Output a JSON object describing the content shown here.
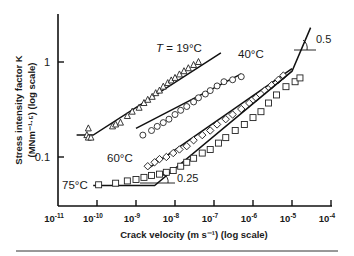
{
  "chart_data": {
    "type": "scatter",
    "title": "",
    "xlabel": "Crack velocity  (m s⁻¹)  (log scale)",
    "ylabel": "Stress intensity factor K",
    "ylabel_units": "(MNm⁻¹·⁵)  (log scale)",
    "x_scale": "log",
    "y_scale": "log",
    "xlim": [
      1e-11,
      0.0001
    ],
    "ylim": [
      0.03,
      3
    ],
    "x_ticks": [
      "10⁻¹¹",
      "10⁻¹⁰",
      "10⁻⁹",
      "10⁻⁸",
      "10⁻⁷",
      "10⁻⁶",
      "10⁻⁵",
      "10⁻⁴"
    ],
    "y_ticks": [
      "1",
      "0.1"
    ],
    "grid": false,
    "legend": "inline labels",
    "series": [
      {
        "name": "T = 19°C",
        "marker": "triangle",
        "points": [
          [
            5.5e-11,
            0.17
          ],
          [
            6e-11,
            0.16
          ],
          [
            7e-11,
            0.16
          ],
          [
            6e-11,
            0.2
          ],
          [
            2.5e-10,
            0.21
          ],
          [
            3e-10,
            0.22
          ],
          [
            4e-10,
            0.23
          ],
          [
            6e-10,
            0.27
          ],
          [
            8e-10,
            0.3
          ],
          [
            1.2e-09,
            0.33
          ],
          [
            1.6e-09,
            0.37
          ],
          [
            2e-09,
            0.4
          ],
          [
            2.6e-09,
            0.43
          ],
          [
            3.2e-09,
            0.47
          ],
          [
            4e-09,
            0.5
          ],
          [
            5e-09,
            0.55
          ],
          [
            6.5e-09,
            0.6
          ],
          [
            8e-09,
            0.64
          ],
          [
            1e-08,
            0.68
          ],
          [
            1.3e-08,
            0.74
          ],
          [
            1.7e-08,
            0.8
          ],
          [
            2.2e-08,
            0.86
          ],
          [
            3e-08,
            0.93
          ],
          [
            4e-08,
            1.0
          ]
        ],
        "fit_line": [
          [
            3e-11,
            0.17
          ],
          [
            8e-11,
            0.17
          ],
          [
            1.5e-07,
            1.25
          ]
        ]
      },
      {
        "name": "40°C",
        "marker": "circle",
        "points": [
          [
            1.5e-09,
            0.17
          ],
          [
            2.5e-09,
            0.19
          ],
          [
            3.5e-09,
            0.21
          ],
          [
            5e-09,
            0.23
          ],
          [
            7e-09,
            0.25
          ],
          [
            1e-08,
            0.28
          ],
          [
            1.4e-08,
            0.31
          ],
          [
            2e-08,
            0.34
          ],
          [
            3e-08,
            0.38
          ],
          [
            4e-08,
            0.42
          ],
          [
            6e-08,
            0.46
          ],
          [
            8e-08,
            0.5
          ],
          [
            1.2e-07,
            0.56
          ],
          [
            1.8e-07,
            0.62
          ],
          [
            3e-07,
            0.65
          ],
          [
            5e-07,
            0.7
          ]
        ],
        "fit_line": [
          [
            1e-09,
            0.2
          ],
          [
            5e-07,
            0.75
          ]
        ]
      },
      {
        "name": "60°C",
        "marker": "diamond",
        "points": [
          [
            2e-09,
            0.08
          ],
          [
            3e-09,
            0.088
          ],
          [
            4e-09,
            0.095
          ],
          [
            6e-09,
            0.1
          ],
          [
            9e-09,
            0.11
          ],
          [
            1.3e-08,
            0.12
          ],
          [
            2e-08,
            0.13
          ],
          [
            3e-08,
            0.15
          ],
          [
            5e-08,
            0.17
          ],
          [
            8e-08,
            0.19
          ],
          [
            1.2e-07,
            0.22
          ],
          [
            2e-07,
            0.25
          ],
          [
            3e-07,
            0.28
          ],
          [
            5e-07,
            0.32
          ],
          [
            8e-07,
            0.37
          ],
          [
            1.2e-06,
            0.42
          ],
          [
            2e-06,
            0.5
          ],
          [
            3e-06,
            0.57
          ],
          [
            4.5e-06,
            0.65
          ],
          [
            6e-06,
            0.72
          ]
        ],
        "fit_line": [
          [
            2e-09,
            0.075
          ],
          [
            1e-05,
            0.85
          ]
        ]
      },
      {
        "name": "75°C",
        "marker": "square",
        "points": [
          [
            1.1e-10,
            0.051
          ],
          [
            3e-10,
            0.053
          ],
          [
            6e-10,
            0.056
          ],
          [
            1e-09,
            0.058
          ],
          [
            1.6e-09,
            0.061
          ],
          [
            2.5e-09,
            0.064
          ],
          [
            4e-09,
            0.066
          ],
          [
            6e-09,
            0.069
          ],
          [
            9e-09,
            0.072
          ],
          [
            1.4e-08,
            0.08
          ],
          [
            2e-08,
            0.088
          ],
          [
            3e-08,
            0.097
          ],
          [
            5e-08,
            0.11
          ],
          [
            8e-08,
            0.12
          ],
          [
            1.3e-07,
            0.14
          ],
          [
            2e-07,
            0.16
          ],
          [
            3.5e-07,
            0.19
          ],
          [
            6e-07,
            0.22
          ],
          [
            1e-06,
            0.26
          ],
          [
            1.6e-06,
            0.3
          ],
          [
            2.5e-06,
            0.37
          ],
          [
            4e-06,
            0.45
          ],
          [
            7e-06,
            0.55
          ],
          [
            1.2e-05,
            0.62
          ],
          [
            1.6e-05,
            0.68
          ]
        ],
        "fit_line": [
          [
            8e-11,
            0.05
          ],
          [
            3e-09,
            0.05
          ],
          [
            1e-05,
            0.8
          ],
          [
            3e-05,
            2.3
          ]
        ]
      }
    ],
    "annotations": [
      {
        "text": "0.25",
        "type": "slope-triangle",
        "near": [
          1.5e-08,
          0.055
        ]
      },
      {
        "text": "0.5",
        "type": "slope-triangle",
        "near": [
          3e-05,
          1.5
        ]
      }
    ]
  },
  "labels": {
    "t19_prefix": "T",
    "t19_suffix": " = 19°C",
    "t40": "40°C",
    "t60": "60°C",
    "t75": "75°C",
    "slope_low": "0.25",
    "slope_high": "0.5",
    "ytick_1": "1",
    "ytick_01": "0.1",
    "xtick_base": "10",
    "xtick_exps": [
      "-11",
      "-10",
      "-9",
      "-8",
      "-7",
      "-6",
      "-5",
      "-4"
    ],
    "ylabel_line1": "Stress intensity factor K",
    "ylabel_line2": "(MNm⁻¹·⁵)  (log scale)",
    "xlabel": "Crack velocity  (m s⁻¹)  (log scale)"
  }
}
